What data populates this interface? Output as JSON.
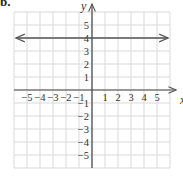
{
  "problem_label": "b.",
  "chart_data": {
    "type": "line",
    "title": "",
    "xlabel": "x",
    "ylabel": "y",
    "xlim": [
      -6,
      6
    ],
    "ylim": [
      -6,
      6
    ],
    "grid": true,
    "x_tick_labels": [
      "−5",
      "−4",
      "−3",
      "−2",
      "−1",
      "1",
      "2",
      "3",
      "4",
      "5"
    ],
    "y_tick_labels": [
      "5",
      "4",
      "3",
      "2",
      "1",
      "−1",
      "−2",
      "−3",
      "−4",
      "−5"
    ],
    "series": [
      {
        "name": "y = 4",
        "equation": "y = 4",
        "x": [
          -6,
          6
        ],
        "y": [
          4,
          4
        ],
        "arrows": "both",
        "color": "#555555"
      }
    ]
  },
  "colors": {
    "grid": "#d9d9d9",
    "axis": "#444444",
    "line": "#555555"
  }
}
